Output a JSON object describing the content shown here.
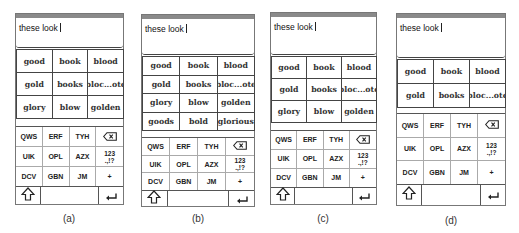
{
  "panels": [
    {
      "id": "a",
      "caption": "(a)",
      "typed_text": "these look",
      "suggestions": [
        "good",
        "book",
        "blood",
        "gold",
        "books",
        "bloc...ote",
        "glory",
        "blow",
        "golden"
      ],
      "keys": [
        "QWS",
        "ERF",
        "TYH",
        "backspace",
        "UIK",
        "OPL",
        "AZX",
        "123\n.,!?",
        "DCV",
        "GBN",
        "JM",
        "+"
      ]
    },
    {
      "id": "b",
      "caption": "(b)",
      "typed_text": "these look",
      "suggestions": [
        "good",
        "book",
        "blood",
        "gold",
        "books",
        "bloc...ote",
        "glory",
        "blow",
        "golden",
        "goods",
        "bold",
        "glorious"
      ],
      "keys": [
        "QWS",
        "ERF",
        "TYH",
        "backspace",
        "UIK",
        "OPL",
        "AZX",
        "123\n.,!?",
        "DCV",
        "GBN",
        "JM",
        "+"
      ]
    },
    {
      "id": "c",
      "caption": "(c)",
      "typed_text": "these look",
      "suggestions": [
        "good",
        "book",
        "blood",
        "gold",
        "books",
        "bloc...ote",
        "glory",
        "blow",
        "golden"
      ],
      "keys": [
        "QWS",
        "ERF",
        "TYH",
        "backspace",
        "UIK",
        "OPL",
        "AZX",
        "123\n.,!?",
        "DCV",
        "GBN",
        "JM",
        "+"
      ]
    },
    {
      "id": "d",
      "caption": "(d)",
      "typed_text": "these look",
      "suggestions": [
        "good",
        "book",
        "blood",
        "gold",
        "books",
        "bloc...ote"
      ],
      "keys": [
        "QWS",
        "ERF",
        "TYH",
        "backspace",
        "UIK",
        "OPL",
        "AZX",
        "123\n.,!?",
        "DCV",
        "GBN",
        "JM",
        "+"
      ]
    }
  ],
  "icons": {
    "backspace": "backspace-icon",
    "shift": "shift-icon",
    "enter": "enter-icon"
  },
  "colors": {
    "status_bar": "#8a8a8a",
    "border": "#444444",
    "key_divider": "#aaaaaa"
  }
}
